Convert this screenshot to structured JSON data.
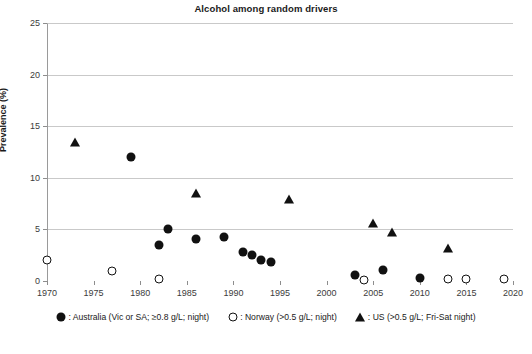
{
  "chart_data": {
    "type": "scatter",
    "title": "Alcohol among random drivers",
    "xlabel": "",
    "ylabel": "Prevalence (%)",
    "xlim": [
      1970,
      2020
    ],
    "ylim": [
      0,
      25
    ],
    "xticks": [
      1970,
      1975,
      1980,
      1985,
      1990,
      1995,
      2000,
      2005,
      2010,
      2015,
      2020
    ],
    "yticks": [
      0,
      5,
      10,
      15,
      20,
      25
    ],
    "grid": "horizontal",
    "legend_position": "below",
    "series": [
      {
        "name": "Australia (Vic or SA; ≥0.8 g/L; night)",
        "marker": "filled-circle",
        "color": "#111111",
        "points": [
          {
            "x": 1979,
            "y": 12.0
          },
          {
            "x": 1982,
            "y": 3.5
          },
          {
            "x": 1983,
            "y": 5.0
          },
          {
            "x": 1986,
            "y": 4.1
          },
          {
            "x": 1989,
            "y": 4.3
          },
          {
            "x": 1991,
            "y": 2.8
          },
          {
            "x": 1992,
            "y": 2.5
          },
          {
            "x": 1993,
            "y": 2.0
          },
          {
            "x": 1994,
            "y": 1.8
          },
          {
            "x": 2003,
            "y": 0.6
          },
          {
            "x": 2006,
            "y": 1.1
          },
          {
            "x": 2010,
            "y": 0.3
          }
        ]
      },
      {
        "name": "Norway (>0.5 g/L; night)",
        "marker": "open-circle",
        "color": "#111111",
        "points": [
          {
            "x": 1970,
            "y": 2.0
          },
          {
            "x": 1977,
            "y": 1.0
          },
          {
            "x": 1982,
            "y": 0.2
          },
          {
            "x": 2004,
            "y": 0.1
          },
          {
            "x": 2013,
            "y": 0.2
          },
          {
            "x": 2015,
            "y": 0.2
          },
          {
            "x": 2019,
            "y": 0.2
          }
        ]
      },
      {
        "name": "US (>0.5 g/L; Fri-Sat night)",
        "marker": "filled-triangle",
        "color": "#111111",
        "points": [
          {
            "x": 1973,
            "y": 13.5
          },
          {
            "x": 1986,
            "y": 8.5
          },
          {
            "x": 1996,
            "y": 7.9
          },
          {
            "x": 2005,
            "y": 5.6
          },
          {
            "x": 2007,
            "y": 4.7
          },
          {
            "x": 2013,
            "y": 3.2
          }
        ]
      }
    ]
  },
  "legend": {
    "items": [
      {
        "symbol": "filled-circle",
        "label": ": Australia (Vic or SA; ≥0.8 g/L; night)"
      },
      {
        "symbol": "open-circle",
        "label": ": Norway (>0.5 g/L; night)"
      },
      {
        "symbol": "filled-triangle",
        "label": ": US (>0.5 g/L; Fri-Sat night)"
      }
    ]
  }
}
